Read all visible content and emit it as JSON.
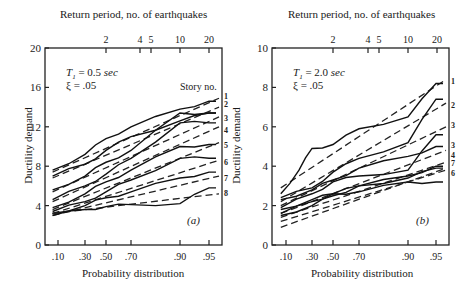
{
  "chart_data": [
    {
      "type": "line",
      "panel_label": "(a)",
      "title": "Return period, no. of earthquakes",
      "xlabel": "Probability distribution",
      "ylabel": "Ductility demand",
      "x_ticks": [
        ".10",
        ".30",
        ".50",
        ".70",
        ".90",
        ".95"
      ],
      "x_tick_values": [
        0.1,
        0.3,
        0.5,
        0.7,
        0.9,
        0.95
      ],
      "top_ticks": [
        "2",
        "4",
        "5",
        "10",
        "20"
      ],
      "y_ticks": [
        "0",
        "4",
        "8",
        "12",
        "16",
        "20"
      ],
      "ylim": [
        0,
        20
      ],
      "grid": false,
      "annotations": {
        "period": "T1 = 0.5 sec",
        "damping": "ξ = .05",
        "legend_header": "Story no."
      },
      "series_style": "solid = empirical, dashed = fitted",
      "series": [
        {
          "name": "1",
          "x": [
            0.06,
            0.3,
            0.5,
            0.7,
            0.9,
            0.95
          ],
          "values": [
            7.6,
            9.2,
            10.8,
            12.0,
            13.8,
            14.6
          ],
          "fit": [
            7.4,
            14.9
          ]
        },
        {
          "name": "2",
          "x": [
            0.06,
            0.3,
            0.5,
            0.7,
            0.9,
            0.95
          ],
          "values": [
            7.0,
            8.2,
            9.6,
            11.0,
            12.6,
            13.4
          ],
          "fit": [
            6.8,
            14.0
          ]
        },
        {
          "name": "3",
          "x": [
            0.06,
            0.3,
            0.5,
            0.7,
            0.9,
            0.95
          ],
          "values": [
            5.6,
            7.0,
            8.4,
            9.6,
            13.4,
            13.4
          ],
          "fit": [
            5.4,
            13.0
          ]
        },
        {
          "name": "4",
          "x": [
            0.06,
            0.3,
            0.5,
            0.7,
            0.9,
            0.95
          ],
          "values": [
            4.6,
            6.0,
            7.2,
            8.8,
            12.4,
            12.4
          ],
          "fit": [
            4.4,
            12.0
          ]
        },
        {
          "name": "5",
          "x": [
            0.06,
            0.3,
            0.5,
            0.7,
            0.9,
            0.95
          ],
          "values": [
            3.8,
            5.2,
            6.4,
            7.6,
            10.0,
            10.2
          ],
          "fit": [
            3.6,
            10.4
          ]
        },
        {
          "name": "6",
          "x": [
            0.06,
            0.3,
            0.5,
            0.7,
            0.9,
            0.95
          ],
          "values": [
            3.4,
            4.4,
            5.4,
            6.6,
            8.8,
            8.8
          ],
          "fit": [
            3.2,
            8.6
          ]
        },
        {
          "name": "7",
          "x": [
            0.06,
            0.3,
            0.5,
            0.7,
            0.9,
            0.95
          ],
          "values": [
            3.2,
            4.0,
            4.8,
            5.4,
            6.8,
            7.4
          ],
          "fit": [
            3.0,
            7.0
          ]
        },
        {
          "name": "8",
          "x": [
            0.06,
            0.3,
            0.5,
            0.7,
            0.9,
            0.95
          ],
          "values": [
            3.0,
            3.6,
            3.9,
            4.1,
            4.2,
            5.8
          ],
          "fit": [
            3.2,
            5.2
          ]
        }
      ]
    },
    {
      "type": "line",
      "panel_label": "(b)",
      "title": "Return period, no. of earthquakes",
      "xlabel": "Probability distribution",
      "ylabel": "Ductility demand",
      "x_ticks": [
        ".10",
        ".30",
        ".50",
        ".70",
        ".90",
        ".95"
      ],
      "x_tick_values": [
        0.1,
        0.3,
        0.5,
        0.7,
        0.9,
        0.95
      ],
      "top_ticks": [
        "2",
        "4",
        "5",
        "10",
        "20"
      ],
      "y_ticks": [
        "0",
        "2",
        "4",
        "6",
        "8",
        "10"
      ],
      "ylim": [
        0,
        10
      ],
      "grid": false,
      "annotations": {
        "period": "T1 = 2.0 sec",
        "damping": "ξ = .05"
      },
      "right_labels": [
        "1",
        "2",
        "3",
        "3",
        "4",
        "7",
        "6"
      ],
      "series_style": "solid = empirical, dashed = fitted",
      "series": [
        {
          "name": "1",
          "x": [
            0.06,
            0.2,
            0.3,
            0.5,
            0.7,
            0.9,
            0.95
          ],
          "values": [
            2.6,
            3.8,
            4.9,
            5.1,
            5.9,
            6.5,
            8.2
          ],
          "fit": [
            2.9,
            8.4
          ]
        },
        {
          "name": "2",
          "x": [
            0.06,
            0.3,
            0.5,
            0.7,
            0.9,
            0.95
          ],
          "values": [
            2.4,
            2.9,
            3.7,
            4.4,
            5.2,
            7.4
          ],
          "fit": [
            2.2,
            7.2
          ]
        },
        {
          "name": "3",
          "x": [
            0.06,
            0.3,
            0.5,
            0.7,
            0.9,
            0.95
          ],
          "values": [
            2.3,
            2.8,
            3.3,
            3.9,
            4.5,
            5.0
          ],
          "fit": [
            2.0,
            6.0
          ]
        },
        {
          "name": "4",
          "x": [
            0.06,
            0.3,
            0.5,
            0.7,
            0.9,
            0.95
          ],
          "values": [
            1.9,
            2.6,
            3.2,
            3.5,
            3.8,
            5.6
          ],
          "fit": [
            1.6,
            4.8
          ]
        },
        {
          "name": "5",
          "x": [
            0.06,
            0.3,
            0.5,
            0.7,
            0.9,
            0.95
          ],
          "values": [
            1.8,
            2.3,
            2.6,
            2.7,
            3.2,
            3.2
          ],
          "fit": [
            1.4,
            4.2
          ]
        },
        {
          "name": "6",
          "x": [
            0.06,
            0.3,
            0.5,
            0.7,
            0.9,
            0.95
          ],
          "values": [
            1.6,
            2.2,
            2.6,
            3.0,
            3.4,
            3.9
          ],
          "fit": [
            1.2,
            3.8
          ]
        },
        {
          "name": "7",
          "x": [
            0.06,
            0.3,
            0.5,
            0.7,
            0.9,
            0.95
          ],
          "values": [
            1.5,
            2.0,
            2.5,
            3.0,
            3.5,
            4.0
          ],
          "fit": [
            0.9,
            3.9
          ]
        }
      ]
    }
  ]
}
